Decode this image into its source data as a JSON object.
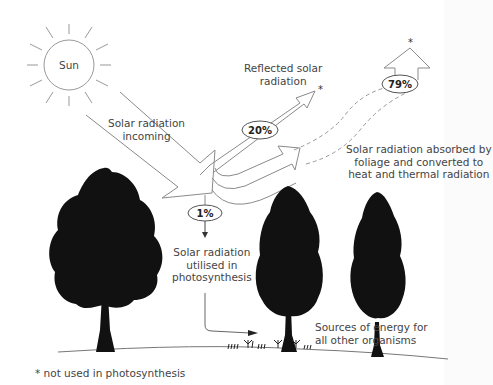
{
  "diagram": {
    "sun_label": "Sun",
    "incoming_label": [
      "Solar radiation",
      "incoming"
    ],
    "reflected_label": [
      "Reflected solar",
      "radiation"
    ],
    "reflected_percent": "20%",
    "absorbed_percent": "79%",
    "absorbed_label": [
      "Solar radiation absorbed by",
      "foliage and converted to",
      "heat and thermal radiation"
    ],
    "photosynthesis_percent": "1%",
    "photosynthesis_label": [
      "Solar radiation",
      "utilised in",
      "photosynthesis"
    ],
    "sources_label": [
      "Sources of energy for",
      "all other organisms"
    ],
    "asterisk": "*",
    "footnote": "* not used in photosynthesis"
  },
  "colors": {
    "line": "#8a8a8a",
    "tree": "#111111",
    "text": "#444444"
  }
}
